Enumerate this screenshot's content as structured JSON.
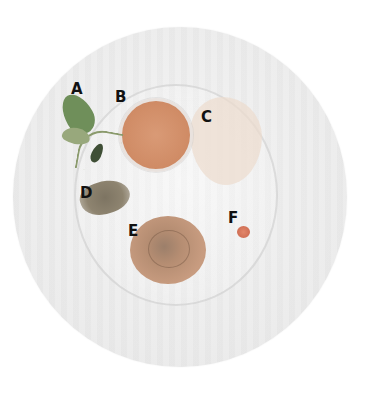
{
  "image": {
    "description": "Top-down photo of a round plate with labeled food components",
    "background": "#ffffff",
    "disc_color": "#ececec"
  },
  "labels": [
    {
      "id": "A",
      "text": "A",
      "item": "leaves / herb sprig",
      "x": 71,
      "y": 82,
      "color": "#6f8f5a"
    },
    {
      "id": "B",
      "text": "B",
      "item": "orange sauce in small bowl",
      "x": 115,
      "y": 90,
      "color": "#d08c66"
    },
    {
      "id": "C",
      "text": "C",
      "item": "pale translucent spread",
      "x": 201,
      "y": 110,
      "color": "#ecdccd"
    },
    {
      "id": "D",
      "text": "D",
      "item": "crumbled granular topping",
      "x": 80,
      "y": 186,
      "color": "#8e8470"
    },
    {
      "id": "E",
      "text": "E",
      "item": "swirled brown mound",
      "x": 128,
      "y": 224,
      "color": "#b58d72"
    },
    {
      "id": "F",
      "text": "F",
      "item": "small red dot",
      "x": 228,
      "y": 211,
      "color": "#c9664c"
    }
  ]
}
